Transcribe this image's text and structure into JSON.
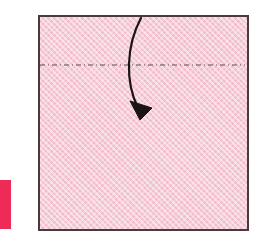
{
  "figure": {
    "caption": "Square sheet of pink paper with a horizontal fold line and a curved fold arrow",
    "canvas": {
      "width": 257,
      "height": 245,
      "background": "#ffffff"
    }
  },
  "colors": {
    "paper_fill": "#f6cdd8",
    "paper_texture_light": "#ffffff",
    "paper_texture_dark": "#e496af",
    "paper_border": "#4a3a3c",
    "fold_line": "#5a4a4c",
    "arrow": "#1a1412",
    "edge_marker": "#ee2a56",
    "background": "#ffffff"
  },
  "paper": {
    "name": "square sheet",
    "shape": "square",
    "x": 38,
    "y": 15,
    "width": 207,
    "height": 212,
    "border_width": 2
  },
  "fold_line": {
    "name": "valley fold crease line",
    "style": "dash-dot",
    "orientation": "horizontal",
    "x1": 40,
    "y1": 65,
    "x2": 245,
    "y2": 65,
    "stroke_width": 1.2,
    "dash_pattern": "5 3 1 3"
  },
  "fold_arrow": {
    "name": "fold direction arrow",
    "direction": "down",
    "path": "M 141 18 C 126 46, 125 82, 138 108",
    "stroke_width": 2.2,
    "head": {
      "points": "130,101 152,108 140,120",
      "tip_x": 140,
      "tip_y": 120
    }
  },
  "edge_marker": {
    "name": "page edge color bar",
    "x": 0,
    "y": 180,
    "width": 11,
    "height": 49
  }
}
